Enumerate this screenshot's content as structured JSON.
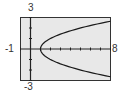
{
  "chart_data": {
    "type": "line",
    "title": "",
    "xlabel": "",
    "ylabel": "",
    "xlim": [
      -1,
      8
    ],
    "ylim": [
      -3,
      3
    ],
    "x_tick_step": 1,
    "y_tick_step": 1,
    "grid": false,
    "legend": null,
    "axis_labels": {
      "xmin": "-1",
      "xmax": "8",
      "ymax": "3",
      "ymin": "-3"
    },
    "series": [
      {
        "name": "x = y^2 + 1",
        "equation": "x = y^2 + 1",
        "points": [
          {
            "x": 8.0,
            "y": -2.65
          },
          {
            "x": 5.0,
            "y": -2.0
          },
          {
            "x": 3.25,
            "y": -1.5
          },
          {
            "x": 2.0,
            "y": -1.0
          },
          {
            "x": 1.25,
            "y": -0.5
          },
          {
            "x": 1.0,
            "y": 0.0
          },
          {
            "x": 1.25,
            "y": 0.5
          },
          {
            "x": 2.0,
            "y": 1.0
          },
          {
            "x": 3.25,
            "y": 1.5
          },
          {
            "x": 5.0,
            "y": 2.0
          },
          {
            "x": 8.0,
            "y": 2.65
          }
        ]
      }
    ]
  },
  "colors": {
    "background": "#e8e8e8",
    "frame": "#333333",
    "axis": "#222222",
    "curve": "#1a1a1a"
  }
}
